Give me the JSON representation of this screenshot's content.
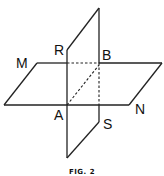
{
  "figure": {
    "caption": "FIG. 2",
    "labels": {
      "M": "M",
      "R": "R",
      "B": "B",
      "A": "A",
      "S": "S",
      "N": "N"
    },
    "line_color": "#222222"
  }
}
